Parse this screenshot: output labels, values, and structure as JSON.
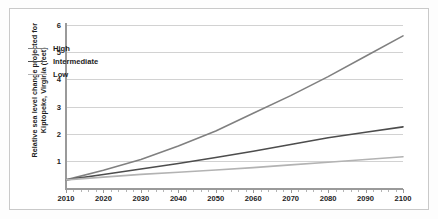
{
  "chart_data": {
    "type": "line",
    "title": "",
    "xlabel": "",
    "ylabel": "Relative sea level change projected for Kiptopeke, Virginia (feet)",
    "xlim": [
      2010,
      2100
    ],
    "ylim": [
      0,
      6
    ],
    "grid": true,
    "legend_position": "upper-left-inside",
    "x_ticks": [
      "2010",
      "2020",
      "2030",
      "2040",
      "2050",
      "2060",
      "2070",
      "2080",
      "2090",
      "2100"
    ],
    "y_ticks": [
      "1",
      "2",
      "3",
      "4",
      "5",
      "6"
    ],
    "x": [
      2010,
      2020,
      2030,
      2040,
      2050,
      2060,
      2070,
      2080,
      2090,
      2100
    ],
    "series": [
      {
        "name": "High",
        "color": "#808080",
        "values": [
          0.3,
          0.65,
          1.05,
          1.55,
          2.1,
          2.75,
          3.4,
          4.1,
          4.85,
          5.6
        ]
      },
      {
        "name": "Intermediate",
        "color": "#4d4d4d",
        "values": [
          0.3,
          0.5,
          0.7,
          0.9,
          1.12,
          1.35,
          1.6,
          1.85,
          2.05,
          2.25
        ]
      },
      {
        "name": "Low",
        "color": "#b3b3b3",
        "values": [
          0.3,
          0.4,
          0.5,
          0.58,
          0.66,
          0.75,
          0.85,
          0.95,
          1.05,
          1.15
        ]
      }
    ]
  },
  "legend": {
    "entries": [
      {
        "label": "High"
      },
      {
        "label": "Intermediate"
      },
      {
        "label": "Low"
      }
    ]
  },
  "colors": {
    "grid": "#d2d2d2",
    "axis": "#9a9a9a",
    "text": "#1d1d1d",
    "frame": "#c9c9c9",
    "background": "#ffffff"
  }
}
